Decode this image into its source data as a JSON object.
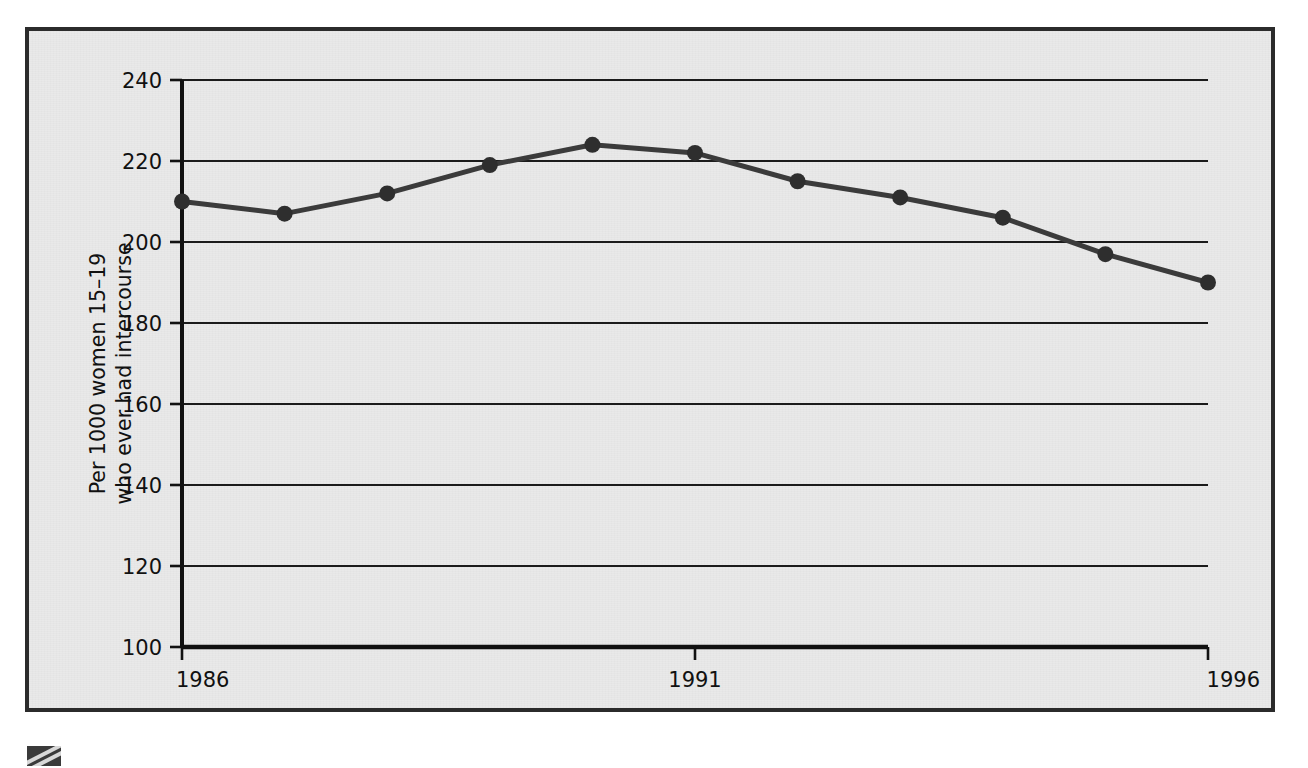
{
  "chart_data": {
    "type": "line",
    "title": "",
    "subtitle": "",
    "xlabel": "",
    "ylabel": "Per 1000 women 15–19 who ever had intercourse",
    "ylabel_lines": [
      "Per 1000 women 15–19",
      "who ever had intercourse"
    ],
    "x": [
      1986,
      1987,
      1988,
      1989,
      1990,
      1991,
      1992,
      1993,
      1994,
      1995,
      1996
    ],
    "values": [
      210,
      207,
      212,
      219,
      224,
      222,
      215,
      211,
      206,
      197,
      190
    ],
    "series": [
      {
        "name": "Per 1000 women 15-19 who ever had intercourse",
        "values": [
          210,
          207,
          212,
          219,
          224,
          222,
          215,
          211,
          206,
          197,
          190
        ]
      }
    ],
    "xlim": [
      1986,
      1996
    ],
    "ylim": [
      100,
      240
    ],
    "xticks": [
      1986,
      1991,
      1996
    ],
    "xtick_labels": [
      "1986",
      "1991",
      "1996"
    ],
    "yticks": [
      100,
      120,
      140,
      160,
      180,
      200,
      220,
      240
    ],
    "ytick_labels": [
      "100",
      "120",
      "140",
      "160",
      "180",
      "200",
      "220",
      "240"
    ],
    "grid": true,
    "grid_axis": "y",
    "legend": false,
    "legend_position": "none",
    "annotations": [],
    "colors": {
      "line": "#3b3b3b",
      "marker": "#2e2e2e",
      "grid": "#1b1b1b",
      "axis": "#111111",
      "plot_background": "#e9e9e9",
      "frame_border": "#2b2b2b",
      "page_background": "#ffffff"
    },
    "marker_style": "circle",
    "line_width_px": 5,
    "marker_radius_px": 8
  },
  "figure": {
    "frame_name": "chart-frame",
    "corner_mark_name": "page-corner-mark"
  }
}
